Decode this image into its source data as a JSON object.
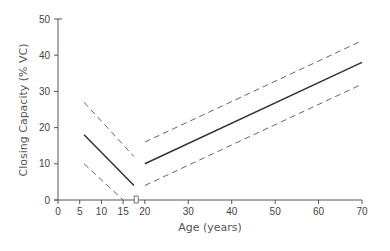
{
  "chart_data": {
    "type": "line",
    "title": "",
    "xlabel": "Age (years)",
    "ylabel": "Closing Capacity (% VC)",
    "xlim": [
      0,
      70
    ],
    "ylim": [
      0,
      50
    ],
    "x_ticks": [
      0,
      5,
      10,
      15,
      20,
      30,
      40,
      50,
      60,
      70
    ],
    "y_ticks": [
      0,
      10,
      20,
      30,
      40,
      50
    ],
    "grid": false,
    "legend": null,
    "axis_break_at_x": 18,
    "series": [
      {
        "name": "Young mean",
        "style": "solid",
        "x": [
          6,
          17.5
        ],
        "y": [
          18,
          4
        ]
      },
      {
        "name": "Young upper limit",
        "style": "dashed",
        "x": [
          6,
          17.5
        ],
        "y": [
          27,
          12
        ]
      },
      {
        "name": "Young lower limit",
        "style": "dashed",
        "x": [
          6,
          15
        ],
        "y": [
          10,
          0
        ]
      },
      {
        "name": "Adult mean",
        "style": "solid",
        "x": [
          20,
          70
        ],
        "y": [
          10,
          38
        ]
      },
      {
        "name": "Adult upper limit",
        "style": "dashed",
        "x": [
          20,
          70
        ],
        "y": [
          16,
          44
        ]
      },
      {
        "name": "Adult lower limit",
        "style": "dashed",
        "x": [
          20,
          70
        ],
        "y": [
          4,
          32
        ]
      }
    ]
  }
}
